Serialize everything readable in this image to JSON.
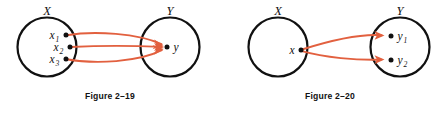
{
  "page": {
    "background_color": "#ffffff",
    "width": 448,
    "height": 113
  },
  "style": {
    "arrow_color": "#e2603f",
    "circle_stroke_color": "#111111",
    "dot_color": "#111111",
    "text_color": "#111111"
  },
  "figures": [
    {
      "id": "figure-2-19",
      "caption": "Figure 2–19",
      "relation_type": "many-to-one",
      "domain_set": {
        "label": "X",
        "center_x": 47,
        "center_y": 47,
        "radius": 29.5,
        "points": [
          {
            "label": "x",
            "subscript": "1",
            "x": 66,
            "y": 35
          },
          {
            "label": "x",
            "subscript": "2",
            "x": 70,
            "y": 47
          },
          {
            "label": "x",
            "subscript": "3",
            "x": 66,
            "y": 59
          }
        ]
      },
      "codomain_set": {
        "label": "Y",
        "center_x": 170,
        "center_y": 47,
        "radius": 29.5,
        "points": [
          {
            "label": "y",
            "subscript": "",
            "x": 167,
            "y": 47
          }
        ]
      },
      "arrows": [
        {
          "from": "x1",
          "to": "y"
        },
        {
          "from": "x2",
          "to": "y"
        },
        {
          "from": "x3",
          "to": "y"
        }
      ]
    },
    {
      "id": "figure-2-20",
      "caption": "Figure 2–20",
      "relation_type": "one-to-many",
      "domain_set": {
        "label": "X",
        "center_x": 278,
        "center_y": 47,
        "radius": 29.5,
        "points": [
          {
            "label": "x",
            "subscript": "",
            "x": 301,
            "y": 50
          }
        ]
      },
      "codomain_set": {
        "label": "Y",
        "center_x": 400,
        "center_y": 47,
        "radius": 29.5,
        "points": [
          {
            "label": "y",
            "subscript": "1",
            "x": 391,
            "y": 36
          },
          {
            "label": "y",
            "subscript": "2",
            "x": 391,
            "y": 60
          }
        ]
      },
      "arrows": [
        {
          "from": "x",
          "to": "y1"
        },
        {
          "from": "x",
          "to": "y2"
        }
      ]
    }
  ]
}
